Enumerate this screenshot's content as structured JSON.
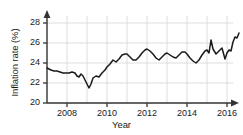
{
  "chart_data": {
    "type": "line",
    "title": "",
    "xlabel": "Year",
    "ylabel": "Inflation rate (%)",
    "xlim": [
      2007.0,
      2016.6
    ],
    "ylim": [
      20,
      29
    ],
    "grid": true,
    "legend": false,
    "xticks": [
      2008,
      2010,
      2012,
      2014,
      2016
    ],
    "xtick_labels": [
      "2008",
      "2010",
      "2012",
      "2014",
      "2016"
    ],
    "yticks": [
      20,
      22,
      24,
      26,
      28
    ],
    "ytick_labels": [
      "20",
      "22",
      "24",
      "26",
      "28"
    ],
    "line_color": "#1a1a1a",
    "grid_color": "#d9d9d9",
    "axis_color": "#333333",
    "series": [
      {
        "name": "Inflation rate",
        "x": [
          2007.0,
          2007.1,
          2007.2,
          2007.35,
          2007.5,
          2007.65,
          2007.8,
          2007.95,
          2008.1,
          2008.25,
          2008.4,
          2008.5,
          2008.6,
          2008.7,
          2008.8,
          2008.9,
          2009.0,
          2009.1,
          2009.2,
          2009.3,
          2009.45,
          2009.6,
          2009.75,
          2009.9,
          2010.0,
          2010.15,
          2010.3,
          2010.45,
          2010.6,
          2010.75,
          2010.9,
          2011.0,
          2011.15,
          2011.3,
          2011.45,
          2011.6,
          2011.75,
          2011.9,
          2012.0,
          2012.15,
          2012.3,
          2012.45,
          2012.6,
          2012.75,
          2012.9,
          2013.0,
          2013.15,
          2013.3,
          2013.45,
          2013.6,
          2013.75,
          2013.9,
          2014.0,
          2014.15,
          2014.3,
          2014.45,
          2014.6,
          2014.75,
          2014.9,
          2015.0,
          2015.1,
          2015.2,
          2015.3,
          2015.45,
          2015.6,
          2015.75,
          2015.9,
          2016.0,
          2016.1,
          2016.2,
          2016.3,
          2016.4,
          2016.5,
          2016.6
        ],
        "y": [
          23.5,
          23.4,
          23.3,
          23.2,
          23.2,
          23.1,
          23.0,
          23.0,
          23.0,
          23.1,
          23.0,
          22.7,
          22.6,
          22.9,
          22.7,
          22.3,
          21.9,
          21.5,
          21.9,
          22.5,
          22.7,
          22.6,
          23.0,
          23.3,
          23.6,
          23.9,
          24.3,
          24.1,
          24.4,
          24.8,
          24.9,
          24.9,
          24.6,
          24.3,
          24.3,
          24.6,
          25.0,
          25.3,
          25.4,
          25.2,
          24.9,
          24.5,
          24.3,
          24.6,
          24.9,
          25.0,
          24.8,
          24.6,
          24.5,
          24.8,
          25.1,
          25.1,
          24.9,
          24.5,
          24.2,
          24.0,
          24.3,
          24.8,
          25.2,
          25.3,
          25.0,
          26.3,
          25.4,
          24.9,
          25.2,
          25.5,
          24.4,
          25.0,
          25.3,
          25.2,
          26.1,
          26.6,
          26.5,
          27.0
        ]
      }
    ]
  }
}
